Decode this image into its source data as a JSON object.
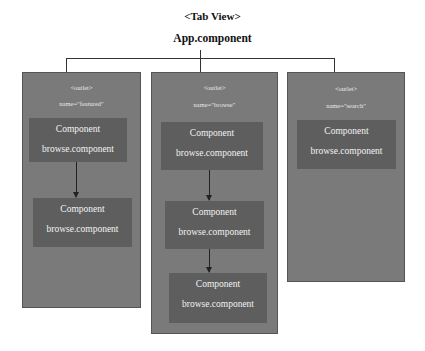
{
  "diagram": {
    "title": "<Tab View>",
    "root": "App.component",
    "outlets": [
      {
        "tag": "<outlet>",
        "name": "name=\"featured\"",
        "components": [
          {
            "line1": "Component",
            "line2": "browse.component"
          },
          {
            "line1": "Component",
            "line2": "browse.component"
          }
        ]
      },
      {
        "tag": "<outlet>",
        "name": "name=\"browse\"",
        "components": [
          {
            "line1": "Component",
            "line2": "browse.component"
          },
          {
            "line1": "Component",
            "line2": "browse.component"
          },
          {
            "line1": "Component",
            "line2": "browse.component"
          }
        ]
      },
      {
        "tag": "<outlet>",
        "name": "name=\"search\"",
        "components": [
          {
            "line1": "Component",
            "line2": "browse.component"
          }
        ]
      }
    ]
  },
  "colors": {
    "outlet_bg": "#7a7a7a",
    "component_bg": "#5e5e5e",
    "text_light": "#f2f2f2",
    "connector": "#333333"
  }
}
